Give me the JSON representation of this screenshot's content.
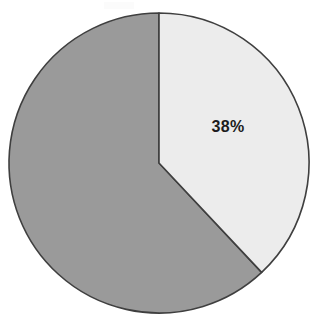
{
  "chart_data": {
    "type": "pie",
    "title": "",
    "subtitle": "",
    "xlabel": "",
    "ylabel": "",
    "grid": false,
    "legend": "none",
    "labels_shown": [
      "38%"
    ],
    "categories": [
      "Segment A",
      "Segment B"
    ],
    "values": [
      38,
      62
    ],
    "units": "percent",
    "total": 100,
    "start_angle_deg": 0,
    "direction": "clockwise",
    "slices": [
      {
        "name": "Segment A",
        "value": 38,
        "label": "38%",
        "label_visible": true,
        "color": "#ececec",
        "start_angle_deg": 0,
        "end_angle_deg": 136.8,
        "label_x": 228,
        "label_y": 128
      },
      {
        "name": "Segment B",
        "value": 62,
        "label": "",
        "label_visible": false,
        "color": "#9a9a9a",
        "start_angle_deg": 136.8,
        "end_angle_deg": 360,
        "label_x": 92,
        "label_y": 200
      }
    ],
    "geometry": {
      "center_x": 159,
      "center_y": 163,
      "radius": 150
    },
    "style": {
      "background": "#ffffff",
      "outline_color": "#3f3f3f",
      "outline_width": 1.6,
      "label_color": "#1c1c1c"
    }
  }
}
